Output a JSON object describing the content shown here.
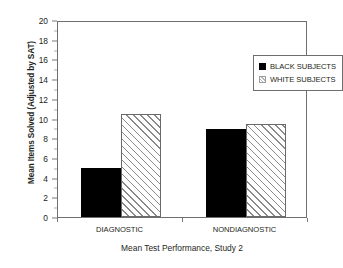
{
  "chart_data": {
    "type": "bar",
    "title": "",
    "xlabel": "Mean Test Performance, Study 2",
    "ylabel": "Mean Items Solved (Adjusted by SAT)",
    "categories": [
      "DIAGNOSTIC",
      "NONDIAGNOSTIC"
    ],
    "series": [
      {
        "name": "BLACK SUBJECTS",
        "values": [
          5.0,
          8.9
        ],
        "fill": "solid-black",
        "color": "#000000"
      },
      {
        "name": "WHITE SUBJECTS",
        "values": [
          10.5,
          9.4
        ],
        "fill": "diagonal-hatch",
        "color": "#ffffff"
      }
    ],
    "ylim": [
      0,
      20
    ],
    "ytick_step": 2,
    "yticks": [
      "0",
      "2",
      "4",
      "6",
      "8",
      "10",
      "12",
      "14",
      "16",
      "18",
      "20"
    ],
    "grid": false,
    "legend_position": "top-right",
    "plot_border": true
  },
  "legend": {
    "items": [
      {
        "label": "BLACK SUBJECTS"
      },
      {
        "label": "WHITE SUBJECTS"
      }
    ]
  }
}
